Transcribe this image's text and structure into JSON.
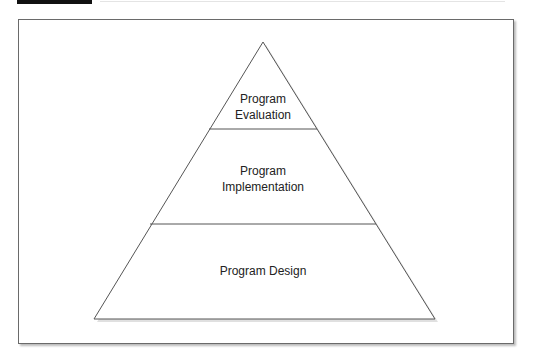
{
  "figure": {
    "tiers": [
      {
        "name": "top",
        "lines": [
          "Program",
          "Evaluation"
        ]
      },
      {
        "name": "middle",
        "lines": [
          "Program",
          "Implementation"
        ]
      },
      {
        "name": "bottom",
        "lines": [
          "Program Design"
        ]
      }
    ],
    "colors": {
      "stroke": "#555555",
      "shadow": "#bbbbbb",
      "header_bar": "#111111"
    }
  }
}
